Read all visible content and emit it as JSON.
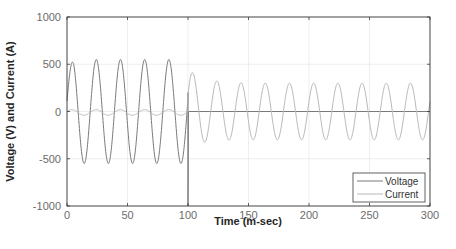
{
  "chart_data": {
    "type": "line",
    "title": "",
    "xlabel": "Time (m-sec)",
    "ylabel": "Voltage (V) and Current (A)",
    "xlim": [
      0,
      300
    ],
    "ylim": [
      -1000,
      1000
    ],
    "xticks": [
      0,
      50,
      100,
      150,
      200,
      250,
      300
    ],
    "yticks": [
      -1000,
      -500,
      0,
      500,
      1000
    ],
    "xtick_labels": [
      "0",
      "50",
      "100",
      "150",
      "200",
      "250",
      "300"
    ],
    "ytick_labels": [
      "-1000",
      "-500",
      "0",
      "500",
      "1000"
    ],
    "grid": true,
    "legend_position": "lower right",
    "series": [
      {
        "name": "Voltage",
        "color": "#7a7a7a",
        "description": "50 Hz sinusoid, amplitude ~550 V (first peak ~450) for 0-100 ms; sharp transient to -1000 V at t=100 ms, then ~0 V for 100-300 ms",
        "segments": [
          {
            "t_start": 0,
            "t_end": 100,
            "amplitude": 550,
            "frequency_hz": 50,
            "phase_deg": -20,
            "first_peak": 450
          },
          {
            "t_at": 100,
            "spike_to": -1000
          },
          {
            "t_start": 100,
            "t_end": 300,
            "value": 0
          }
        ]
      },
      {
        "name": "Current",
        "color": "#b8b8b8",
        "description": "Small ~30 A ripple for 0-100 ms, then 50 Hz sinusoid ~300 A amplitude (first peak ~420 A) for 100-300 ms",
        "segments": [
          {
            "t_start": 0,
            "t_end": 100,
            "amplitude": 30,
            "frequency_hz": 50
          },
          {
            "t_start": 100,
            "t_end": 300,
            "amplitude": 300,
            "frequency_hz": 50,
            "first_peak": 420
          }
        ]
      }
    ]
  },
  "legend": {
    "items": [
      {
        "label": "Voltage",
        "color": "#7a7a7a"
      },
      {
        "label": "Current",
        "color": "#b8b8b8"
      }
    ]
  }
}
